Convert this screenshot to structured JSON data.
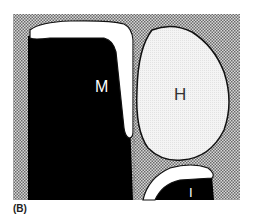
{
  "figure": {
    "caption": "(B)",
    "structures": [
      {
        "id": "M",
        "label": "M",
        "fill": "#000000",
        "cap_fill": "#ffffff"
      },
      {
        "id": "H",
        "label": "H",
        "fill": "#f2f2f2"
      },
      {
        "id": "I",
        "label": "I",
        "fill": "#000000",
        "cap_fill": "#ffffff"
      }
    ],
    "colors": {
      "background_stipple": "#9a9a9a",
      "outline": "#111111",
      "label_on_dark": "#ffffff",
      "label_on_light": "#333333"
    }
  }
}
